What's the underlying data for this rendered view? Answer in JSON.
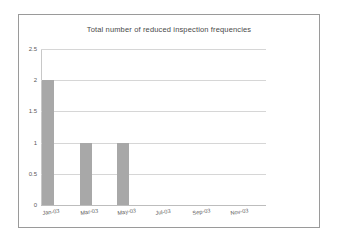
{
  "chart_data": {
    "type": "bar",
    "title": "Total number of reduced inspection frequencies",
    "categories": [
      "Jan-03",
      "Mar-03",
      "May-03",
      "Jul-03",
      "Sep-03",
      "Nov-03"
    ],
    "values": [
      2,
      1,
      1,
      0,
      0,
      0
    ],
    "xlabel": "",
    "ylabel": "",
    "ylim": [
      0,
      2.5
    ],
    "yticks": [
      "0",
      "0.5",
      "1",
      "1.5",
      "2",
      "2.5"
    ],
    "ytick_values": [
      0,
      0.5,
      1,
      1.5,
      2,
      2.5
    ],
    "grid": true,
    "legend": false,
    "series_color": "#a8a8a8",
    "gridline_color": "#d6d6d6",
    "frame_color": "#9a9a9a",
    "title_color": "#4a4a4a",
    "tick_label_color": "#5a5a5a",
    "plot_background": "#ffffff",
    "page_background": "#ffffff"
  }
}
